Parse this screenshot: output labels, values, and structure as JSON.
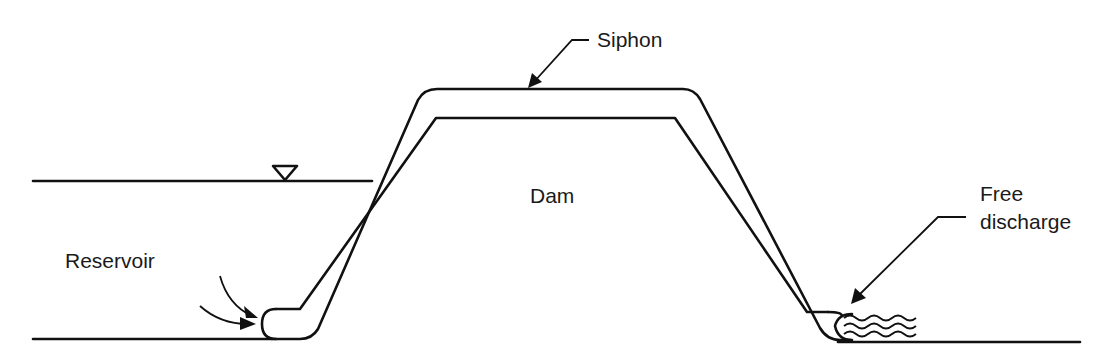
{
  "diagram": {
    "labels": {
      "siphon": "Siphon",
      "dam": "Dam",
      "reservoir": "Reservoir",
      "free_discharge_line1": "Free",
      "free_discharge_line2": "discharge"
    },
    "symbols": {
      "water_surface": "inverted-triangle-water-level-icon"
    },
    "colors": {
      "stroke": "#111111",
      "background": "#ffffff",
      "text": "#1a1a1a"
    }
  }
}
